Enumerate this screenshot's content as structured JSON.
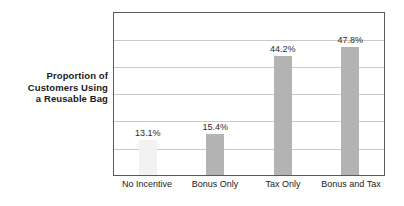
{
  "chart_data": {
    "type": "bar",
    "title": "",
    "subtitle": "",
    "xlabel": "",
    "ylabel": "Proportion of Customers Using a Reusable Bag",
    "ylabel_lines": [
      "Proportion of",
      "Customers Using",
      "a Reusable Bag"
    ],
    "categories": [
      "No Incentive",
      "Bonus Only",
      "Tax Only",
      "Bonus and Tax"
    ],
    "values": [
      13.1,
      15.4,
      44.2,
      47.8
    ],
    "data_labels": [
      "13.1%",
      "15.4%",
      "44.2%",
      "47.8%"
    ],
    "ylim": [
      0,
      60
    ],
    "y_tick_values": [
      0,
      10,
      20,
      30,
      40,
      50,
      60
    ],
    "y_tick_labels": [],
    "gridlines": 5,
    "grid": true,
    "legend": false,
    "legend_position": "none",
    "units": "percent",
    "bar_colors": [
      "#f2f2f2",
      "#b3b3b3",
      "#b3b3b3",
      "#b3b3b3"
    ],
    "frame_color": "#5a5a5a",
    "gridline_color": "#c9c9c9",
    "background_color": "#ffffff",
    "text_color": "#1a1a1a"
  }
}
